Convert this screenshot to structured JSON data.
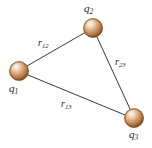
{
  "figure": {
    "type": "physics-diagram",
    "width": 152,
    "height": 148,
    "background_color": "#ffffff"
  },
  "charges": [
    {
      "id": "q1",
      "label": "q",
      "subscript": "1",
      "cx": 19,
      "cy": 71,
      "r": 9.5,
      "label_x": 9,
      "label_y": 83
    },
    {
      "id": "q2",
      "label": "q",
      "subscript": "2",
      "cx": 93,
      "cy": 28,
      "r": 9.5,
      "label_x": 84,
      "label_y": 3
    },
    {
      "id": "q3",
      "label": "q",
      "subscript": "3",
      "cx": 134,
      "cy": 118,
      "r": 9.5,
      "label_x": 129,
      "label_y": 129
    }
  ],
  "distances": [
    {
      "id": "r12",
      "label": "r",
      "subscript": "12",
      "from": "q1",
      "to": "q2",
      "x1": 27,
      "y1": 66,
      "x2": 86,
      "y2": 32,
      "label_x": 38,
      "label_y": 38
    },
    {
      "id": "r23",
      "label": "r",
      "subscript": "23",
      "from": "q2",
      "to": "q3",
      "x1": 97,
      "y1": 37,
      "x2": 130,
      "y2": 109,
      "label_x": 115,
      "label_y": 57
    },
    {
      "id": "r13",
      "label": "r",
      "subscript": "13",
      "from": "q1",
      "to": "q3",
      "x1": 28,
      "y1": 75,
      "x2": 125,
      "y2": 115,
      "label_x": 61,
      "label_y": 99
    }
  ],
  "style": {
    "line_color": "#3a3a3a",
    "line_width": 1,
    "sphere_highlight_color": "#f7eadf",
    "sphere_mid_color": "#d9a97e",
    "sphere_edge_color": "#8a5326",
    "sphere_shadow_color": "#6d3f1c",
    "text_color": "#1a1a1a"
  }
}
